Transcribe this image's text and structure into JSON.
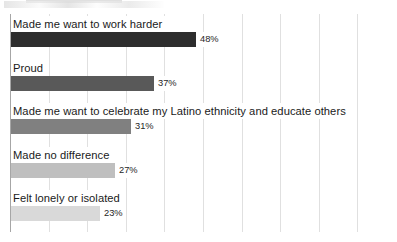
{
  "chart_data": {
    "type": "bar",
    "orientation": "horizontal",
    "title": "",
    "subtitle": "",
    "xlabel": "",
    "ylabel": "",
    "categories": [
      "Made me want to work harder",
      "Proud",
      "Made me want to celebrate my Latino ethnicity and educate others",
      "Made no difference",
      "Felt lonely or isolated"
    ],
    "values": [
      48,
      37,
      31,
      27,
      23
    ],
    "value_labels": [
      "48%",
      "37%",
      "31%",
      "27%",
      "23%"
    ],
    "bar_colors": [
      "#2d2d2d",
      "#595959",
      "#808080",
      "#bfbfbf",
      "#d9d9d9"
    ],
    "xlim": [
      0,
      100
    ],
    "grid": true,
    "grid_step": 10,
    "gridline_color": "#e0e0e0",
    "axis_color": "#a6a6a6",
    "legend": "none",
    "xtick_labels": [],
    "ytick_labels": []
  },
  "chart": {
    "background": "#ffffff",
    "label_color": "#1a1a1a",
    "value_color": "#262626"
  }
}
